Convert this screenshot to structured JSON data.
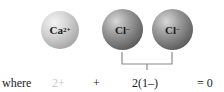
{
  "diagram": {
    "ions": [
      {
        "symbol": "Ca",
        "charge": "2+"
      },
      {
        "symbol": "Cl",
        "charge": "−"
      },
      {
        "symbol": "Cl",
        "charge": "−"
      }
    ],
    "equation": {
      "prefix": "where",
      "term1": "2+",
      "plus": "+",
      "term2": "2(1–)",
      "result": "= 0"
    },
    "colors": {
      "calcium": "#c0c0c0",
      "chloride": "#6e6e6e",
      "bracket": "#888888",
      "faded_text": "#c8c8c8"
    }
  }
}
